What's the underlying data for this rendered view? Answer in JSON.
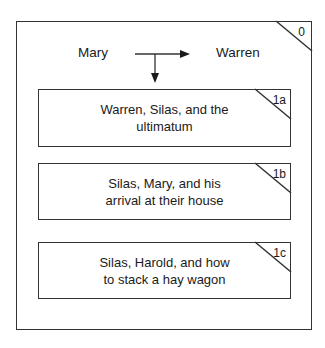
{
  "diagram": {
    "outer_box": {
      "id_label": "0"
    },
    "top_row": {
      "left_node": "Mary",
      "right_node": "Warren"
    },
    "sub_boxes": [
      {
        "id_label": "1a",
        "line1": "Warren, Silas, and the",
        "line2": "ultimatum"
      },
      {
        "id_label": "1b",
        "line1": "Silas, Mary, and his",
        "line2": "arrival at their house"
      },
      {
        "id_label": "1c",
        "line1": "Silas, Harold, and how",
        "line2": "to stack a hay wagon"
      }
    ],
    "colors": {
      "stroke": "#333333",
      "text": "#1a1a1a",
      "background": "#ffffff"
    }
  }
}
